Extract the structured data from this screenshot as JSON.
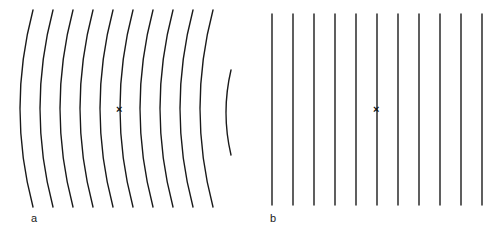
{
  "figure": {
    "width": 500,
    "height": 237,
    "background_color": "#ffffff",
    "stroke_color": "#1a1a1a",
    "marker_color": "#111111",
    "label_color": "#1a1a1a"
  },
  "panels": [
    {
      "id": "a",
      "label": "a",
      "label_x": 31,
      "label_y": 213,
      "description": "curved wavefronts",
      "marker": {
        "symbol": "×",
        "x": 120,
        "y": 110
      }
    },
    {
      "id": "b",
      "label": "b",
      "label_x": 270,
      "label_y": 213,
      "description": "straight parallel wavefronts",
      "marker": {
        "symbol": "×",
        "x": 377,
        "y": 110
      }
    }
  ],
  "chart_data": {
    "type": "line",
    "title": "",
    "subtitle": "",
    "xlabel": "",
    "ylabel": "",
    "grid": false,
    "legend": "none",
    "xlim": [
      0,
      500
    ],
    "ylim": [
      0,
      237
    ],
    "annotations": [
      {
        "text": "a",
        "x": 31,
        "y": 219
      },
      {
        "text": "b",
        "x": 270,
        "y": 219
      },
      {
        "text": "×",
        "x": 120,
        "y": 110
      },
      {
        "text": "×",
        "x": 377,
        "y": 110
      }
    ],
    "series": [
      {
        "name": "panel-a-curved-wavefronts",
        "panel": "a",
        "type": "arc",
        "stroke_width": 1.4,
        "note": "ten full arcs bowing rightward plus one short arc at right edge",
        "arcs": [
          {
            "x_top": 33,
            "y_top": 10,
            "x_mid": 20,
            "y_mid": 110,
            "x_bottom": 33,
            "y_bottom": 207
          },
          {
            "x_top": 53,
            "y_top": 10,
            "x_mid": 40,
            "y_mid": 110,
            "x_bottom": 53,
            "y_bottom": 207
          },
          {
            "x_top": 73,
            "y_top": 10,
            "x_mid": 60,
            "y_mid": 110,
            "x_bottom": 73,
            "y_bottom": 207
          },
          {
            "x_top": 93,
            "y_top": 10,
            "x_mid": 80,
            "y_mid": 110,
            "x_bottom": 93,
            "y_bottom": 207
          },
          {
            "x_top": 113,
            "y_top": 10,
            "x_mid": 100,
            "y_mid": 110,
            "x_bottom": 113,
            "y_bottom": 207
          },
          {
            "x_top": 133,
            "y_top": 10,
            "x_mid": 120,
            "y_mid": 110,
            "x_bottom": 133,
            "y_bottom": 207
          },
          {
            "x_top": 153,
            "y_top": 10,
            "x_mid": 140,
            "y_mid": 110,
            "x_bottom": 153,
            "y_bottom": 207
          },
          {
            "x_top": 173,
            "y_top": 10,
            "x_mid": 160,
            "y_mid": 110,
            "x_bottom": 173,
            "y_bottom": 207
          },
          {
            "x_top": 193,
            "y_top": 10,
            "x_mid": 180,
            "y_mid": 110,
            "x_bottom": 193,
            "y_bottom": 207
          },
          {
            "x_top": 213,
            "y_top": 10,
            "x_mid": 200,
            "y_mid": 110,
            "x_bottom": 213,
            "y_bottom": 207
          },
          {
            "x_top": 231,
            "y_top": 70,
            "x_mid": 226,
            "y_mid": 112,
            "x_bottom": 231,
            "y_bottom": 155
          }
        ]
      },
      {
        "name": "panel-b-straight-wavefronts",
        "panel": "b",
        "type": "vline",
        "stroke_width": 1.4,
        "y_top": 14,
        "y_bottom": 205,
        "x_values": [
          272,
          293,
          314,
          335,
          356,
          377,
          398,
          419,
          440,
          461,
          482
        ]
      }
    ]
  }
}
